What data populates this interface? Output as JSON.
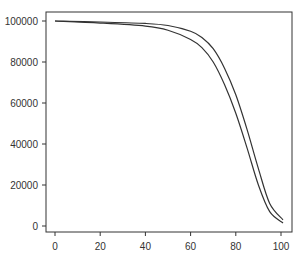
{
  "chart_data": {
    "type": "line",
    "title": "",
    "xlabel": "",
    "ylabel": "",
    "xlim": [
      0,
      100
    ],
    "ylim": [
      0,
      100000
    ],
    "grid": false,
    "legend": null,
    "x_ticks": [
      "0",
      "20",
      "40",
      "60",
      "80",
      "100"
    ],
    "y_ticks": [
      "0",
      "20000",
      "40000",
      "60000",
      "80000",
      "100000"
    ],
    "x": [
      0,
      20,
      40,
      50,
      60,
      65,
      70,
      75,
      80,
      85,
      90,
      95,
      100
    ],
    "series": [
      {
        "name": "curve-inner",
        "values": [
          100000,
          99000,
          97500,
          95500,
          91000,
          87000,
          80000,
          69000,
          55000,
          38000,
          20000,
          7000,
          1500
        ]
      },
      {
        "name": "curve-outer",
        "values": [
          100000,
          99500,
          98800,
          97800,
          95000,
          92000,
          86500,
          77000,
          64000,
          47000,
          28000,
          11000,
          3000
        ]
      }
    ],
    "colors": {
      "line": "#333333",
      "axis": "#333333"
    }
  }
}
